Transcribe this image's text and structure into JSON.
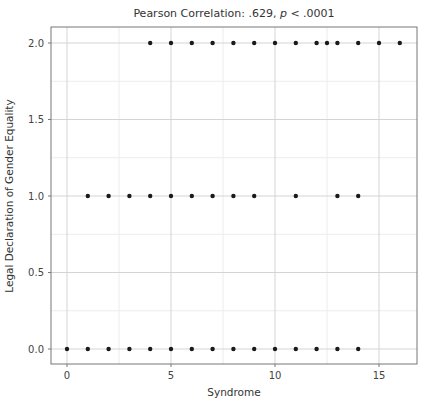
{
  "chart_data": {
    "type": "scatter",
    "title": "Pearson Correlation: .629, p < .0001",
    "title_parts": {
      "prefix": "Pearson Correlation: .629, ",
      "italic": "p",
      "suffix": " < .0001"
    },
    "xlabel": "Syndrome",
    "ylabel": "Legal Declaration of Gender Equality",
    "xlim": [
      -0.8,
      16.8
    ],
    "ylim": [
      -0.1,
      2.1
    ],
    "x_ticks": [
      0,
      5,
      10,
      15
    ],
    "x_tick_labels": [
      "0",
      "5",
      "10",
      "15"
    ],
    "y_ticks": [
      0.0,
      0.5,
      1.0,
      1.5,
      2.0
    ],
    "y_tick_labels": [
      "0.0",
      "0.5",
      "1.0",
      "1.5",
      "2.0"
    ],
    "grid": true,
    "legend": null,
    "series": [
      {
        "name": "observations",
        "points": [
          [
            0,
            0
          ],
          [
            1,
            0
          ],
          [
            2,
            0
          ],
          [
            3,
            0
          ],
          [
            4,
            0
          ],
          [
            5,
            0
          ],
          [
            6,
            0
          ],
          [
            7,
            0
          ],
          [
            8,
            0
          ],
          [
            9,
            0
          ],
          [
            10,
            0
          ],
          [
            11,
            0
          ],
          [
            12,
            0
          ],
          [
            13,
            0
          ],
          [
            14,
            0
          ],
          [
            1,
            1
          ],
          [
            2,
            1
          ],
          [
            3,
            1
          ],
          [
            4,
            1
          ],
          [
            5,
            1
          ],
          [
            6,
            1
          ],
          [
            7,
            1
          ],
          [
            8,
            1
          ],
          [
            9,
            1
          ],
          [
            11,
            1
          ],
          [
            13,
            1
          ],
          [
            14,
            1
          ],
          [
            4,
            2
          ],
          [
            5,
            2
          ],
          [
            6,
            2
          ],
          [
            7,
            2
          ],
          [
            8,
            2
          ],
          [
            9,
            2
          ],
          [
            10,
            2
          ],
          [
            11,
            2
          ],
          [
            12,
            2
          ],
          [
            12.5,
            2
          ],
          [
            13,
            2
          ],
          [
            14,
            2
          ],
          [
            15,
            2
          ],
          [
            16,
            2
          ]
        ]
      }
    ]
  },
  "colors": {
    "point": "#1a1a1a",
    "grid_major": "#d4d4d4",
    "grid_minor": "#ececec",
    "frame": "#777777"
  }
}
